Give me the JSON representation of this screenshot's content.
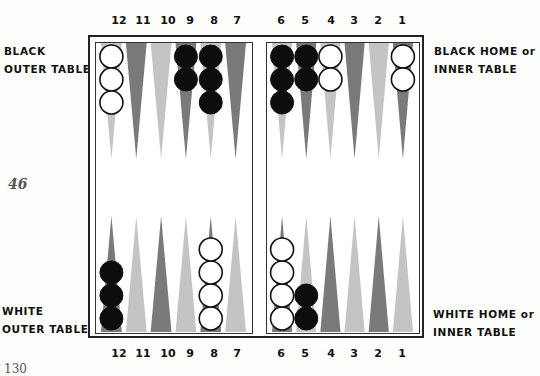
{
  "page": {
    "page_number": "46",
    "footer_fragment": "130"
  },
  "labels": {
    "black_outer": [
      "BLACK",
      "OUTER TABLE"
    ],
    "black_home": [
      "BLACK HOME or",
      "INNER TABLE"
    ],
    "white_outer": [
      "WHITE",
      "OUTER TABLE"
    ],
    "white_home": [
      "WHITE HOME or",
      "INNER TABLE"
    ]
  },
  "point_numbers": {
    "left": [
      "12",
      "11",
      "10",
      "9",
      "8",
      "7"
    ],
    "right": [
      "6",
      "5",
      "4",
      "3",
      "2",
      "1"
    ]
  },
  "colors": {
    "dark_point": "#7a7a7a",
    "light_point": "#c4c4c4",
    "black_checker": "#0d0d0d",
    "white_checker": "#ffffff",
    "frame": "#222222"
  },
  "board": {
    "top_left": [
      {
        "point": "12",
        "shade": "light",
        "checkers": {
          "color": "white",
          "count": 3
        }
      },
      {
        "point": "11",
        "shade": "dark",
        "checkers": null
      },
      {
        "point": "10",
        "shade": "light",
        "checkers": null
      },
      {
        "point": "9",
        "shade": "dark",
        "checkers": {
          "color": "black",
          "count": 2
        }
      },
      {
        "point": "8",
        "shade": "light",
        "checkers": {
          "color": "black",
          "count": 3
        }
      },
      {
        "point": "7",
        "shade": "dark",
        "checkers": null
      }
    ],
    "top_right": [
      {
        "point": "6",
        "shade": "light",
        "checkers": {
          "color": "black",
          "count": 3
        }
      },
      {
        "point": "5",
        "shade": "dark",
        "checkers": {
          "color": "black",
          "count": 2
        }
      },
      {
        "point": "4",
        "shade": "light",
        "checkers": {
          "color": "white",
          "count": 2
        }
      },
      {
        "point": "3",
        "shade": "dark",
        "checkers": null
      },
      {
        "point": "2",
        "shade": "light",
        "checkers": null
      },
      {
        "point": "1",
        "shade": "dark",
        "checkers": {
          "color": "white",
          "count": 2
        }
      }
    ],
    "bottom_left": [
      {
        "point": "12",
        "shade": "dark",
        "checkers": {
          "color": "black",
          "count": 3
        }
      },
      {
        "point": "11",
        "shade": "light",
        "checkers": null
      },
      {
        "point": "10",
        "shade": "dark",
        "checkers": null
      },
      {
        "point": "9",
        "shade": "light",
        "checkers": null
      },
      {
        "point": "8",
        "shade": "dark",
        "checkers": {
          "color": "white",
          "count": 4
        }
      },
      {
        "point": "7",
        "shade": "light",
        "checkers": null
      }
    ],
    "bottom_right": [
      {
        "point": "6",
        "shade": "dark",
        "checkers": {
          "color": "white",
          "count": 4
        }
      },
      {
        "point": "5",
        "shade": "light",
        "checkers": {
          "color": "black",
          "count": 2
        }
      },
      {
        "point": "4",
        "shade": "dark",
        "checkers": null
      },
      {
        "point": "3",
        "shade": "light",
        "checkers": null
      },
      {
        "point": "2",
        "shade": "dark",
        "checkers": null
      },
      {
        "point": "1",
        "shade": "light",
        "checkers": null
      }
    ]
  }
}
